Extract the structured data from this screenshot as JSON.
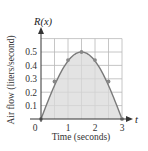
{
  "chart_data": {
    "type": "area",
    "title": "",
    "function_label": "R(x)",
    "xlabel": "Time (seconds)",
    "ylabel": "Air flow (liters/second)",
    "x_axis_var": "t",
    "x": [
      0,
      0.5,
      1,
      1.5,
      2,
      2.5,
      3
    ],
    "series": [
      {
        "name": "R(x)",
        "values": [
          0,
          0.28,
          0.44,
          0.5,
          0.44,
          0.28,
          0
        ]
      }
    ],
    "xlim": [
      0,
      3
    ],
    "ylim": [
      0,
      0.6
    ],
    "x_ticks": [
      "0",
      "1",
      "2",
      "3"
    ],
    "y_ticks": [
      "0.1",
      "0.2",
      "0.3",
      "0.4",
      "0.5"
    ],
    "grid": true,
    "grid_step_x": 0.5,
    "grid_step_y": 0.1,
    "legend": "none",
    "colors": {
      "fill": "#d9d9d9",
      "curve": "#7a7a7a",
      "points": "#888888",
      "grid": "#b8b8b8",
      "axis": "#333333"
    }
  }
}
